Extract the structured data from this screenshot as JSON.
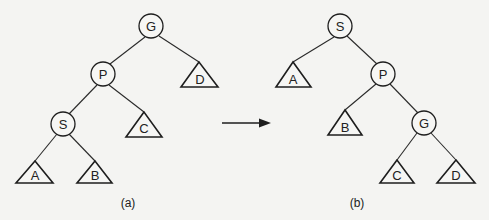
{
  "diagram": {
    "type": "tree-rotation",
    "panels": [
      {
        "id": "a",
        "caption": "(a)",
        "nodes": [
          {
            "label": "G",
            "shape": "circle",
            "x": 151,
            "y": 26
          },
          {
            "label": "P",
            "shape": "circle",
            "x": 103,
            "y": 74
          },
          {
            "label": "D",
            "shape": "triangle",
            "x": 199,
            "y": 62
          },
          {
            "label": "S",
            "shape": "circle",
            "x": 63,
            "y": 124
          },
          {
            "label": "C",
            "shape": "triangle",
            "x": 144,
            "y": 112
          },
          {
            "label": "A",
            "shape": "triangle",
            "x": 35,
            "y": 161
          },
          {
            "label": "B",
            "shape": "triangle",
            "x": 95,
            "y": 161
          }
        ],
        "edges": [
          [
            "G",
            "P"
          ],
          [
            "G",
            "D"
          ],
          [
            "P",
            "S"
          ],
          [
            "P",
            "C"
          ],
          [
            "S",
            "A"
          ],
          [
            "S",
            "B"
          ]
        ]
      },
      {
        "id": "b",
        "caption": "(b)",
        "nodes": [
          {
            "label": "S",
            "shape": "circle",
            "x": 340,
            "y": 26
          },
          {
            "label": "A",
            "shape": "triangle",
            "x": 293,
            "y": 62
          },
          {
            "label": "P",
            "shape": "circle",
            "x": 383,
            "y": 74
          },
          {
            "label": "B",
            "shape": "triangle",
            "x": 345,
            "y": 110
          },
          {
            "label": "G",
            "shape": "circle",
            "x": 424,
            "y": 123
          },
          {
            "label": "C",
            "shape": "triangle",
            "x": 397,
            "y": 160
          },
          {
            "label": "D",
            "shape": "triangle",
            "x": 456,
            "y": 160
          }
        ],
        "edges": [
          [
            "S",
            "A"
          ],
          [
            "S",
            "P"
          ],
          [
            "P",
            "B"
          ],
          [
            "P",
            "G"
          ],
          [
            "G",
            "C"
          ],
          [
            "G",
            "D"
          ]
        ]
      }
    ],
    "arrow": {
      "from": [
        222,
        123
      ],
      "to": [
        271,
        123
      ],
      "direction": "right"
    }
  },
  "labels": {
    "a": {
      "G": "G",
      "P": "P",
      "D": "D",
      "S": "S",
      "C": "C",
      "A": "A",
      "B": "B",
      "caption": "(a)"
    },
    "b": {
      "S": "S",
      "A": "A",
      "P": "P",
      "B": "B",
      "G": "G",
      "C": "C",
      "D": "D",
      "caption": "(b)"
    }
  }
}
